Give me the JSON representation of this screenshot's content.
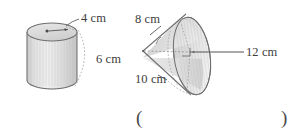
{
  "figure": {
    "name": "geometry-solids-figure",
    "background_color": "#ffffff",
    "ink_color": "#3c3c3c",
    "fill_color": "#d8d8d8",
    "answer_blank": {
      "open_paren": "(",
      "close_paren": ")"
    },
    "shapes": [
      {
        "id": "cylinder",
        "type": "cylinder",
        "labels": [
          {
            "id": "cylinder-radius",
            "text": "4 cm",
            "value": 4,
            "unit": "cm",
            "measures": "radius"
          },
          {
            "id": "cylinder-height",
            "text": "6 cm",
            "value": 6,
            "unit": "cm",
            "measures": "height"
          }
        ]
      },
      {
        "id": "cone",
        "type": "cone",
        "labels": [
          {
            "id": "cone-slant-height",
            "text": "8 cm",
            "value": 8,
            "unit": "cm",
            "measures": "slant-height"
          },
          {
            "id": "cone-diameter",
            "text": "12 cm",
            "value": 12,
            "unit": "cm",
            "measures": "diameter"
          },
          {
            "id": "cone-base-edge",
            "text": "10 cm",
            "value": 10,
            "unit": "cm",
            "measures": "base-edge"
          }
        ]
      }
    ]
  },
  "labels": {
    "cylinder_radius": "4 cm",
    "cylinder_height": "6 cm",
    "cone_slant": "8 cm",
    "cone_diameter": "12 cm",
    "cone_base": "10 cm"
  },
  "answer": {
    "open": "(",
    "close": ")"
  }
}
